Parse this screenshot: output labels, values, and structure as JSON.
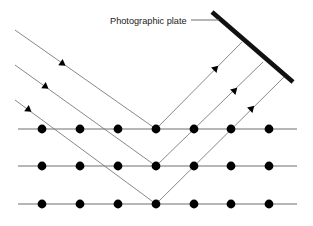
{
  "diagram": {
    "title_label": "Photographic plate",
    "colors": {
      "background": "#ffffff",
      "atom": "#000000",
      "lattice_line": "#6e6e6e",
      "ray_line": "#7a7a7a",
      "plate": "#111111",
      "leader_line": "#6e6e6e",
      "text": "#1a1a1a"
    },
    "photographic_plate": {
      "name": "photographic-plate",
      "x1": 212,
      "y1": 12,
      "x2": 293,
      "y2": 82,
      "stroke_width": 4.6
    },
    "leader_line": {
      "name": "label-leader-line",
      "x1": 191,
      "y1": 20,
      "x2": 219,
      "y2": 20
    },
    "label_position": {
      "x": 110,
      "y": 24
    },
    "lattice_rows": [
      {
        "name": "lattice-row-1",
        "y": 129,
        "x_start": 18,
        "x_end": 297,
        "atom_x": [
          42,
          80,
          118,
          156,
          194,
          231,
          269
        ]
      },
      {
        "name": "lattice-row-2",
        "y": 166,
        "x_start": 18,
        "x_end": 297,
        "atom_x": [
          42,
          80,
          118,
          156,
          194,
          231,
          269
        ]
      },
      {
        "name": "lattice-row-3",
        "y": 204,
        "x_start": 18,
        "x_end": 297,
        "atom_x": [
          42,
          80,
          118,
          156,
          194,
          231,
          269
        ]
      }
    ],
    "atom_radius": 4.4,
    "incident_rays": [
      {
        "name": "incident-ray-1",
        "x1": 15,
        "y1": 30,
        "x2": 156,
        "y2": 129,
        "arrow_x": 63,
        "arrow_y": 64
      },
      {
        "name": "incident-ray-2",
        "x1": 15,
        "y1": 65,
        "x2": 156,
        "y2": 166,
        "arrow_x": 46,
        "arrow_y": 87
      },
      {
        "name": "incident-ray-3",
        "x1": 15,
        "y1": 100,
        "x2": 156,
        "y2": 204,
        "arrow_x": 29,
        "arrow_y": 110
      }
    ],
    "reflected_rays": [
      {
        "name": "reflected-ray-1",
        "x1": 156,
        "y1": 129,
        "x2": 242,
        "y2": 42,
        "arrow_x": 216,
        "arrow_y": 68
      },
      {
        "name": "reflected-ray-2",
        "x1": 156,
        "y1": 166,
        "x2": 263,
        "y2": 62,
        "arrow_x": 235,
        "arrow_y": 90
      },
      {
        "name": "reflected-ray-3",
        "x1": 156,
        "y1": 204,
        "x2": 285,
        "y2": 76,
        "arrow_x": 252,
        "arrow_y": 108
      }
    ],
    "ray_stroke_width": 0.9,
    "lattice_stroke_width": 1.0,
    "arrow_size": 6.2
  }
}
